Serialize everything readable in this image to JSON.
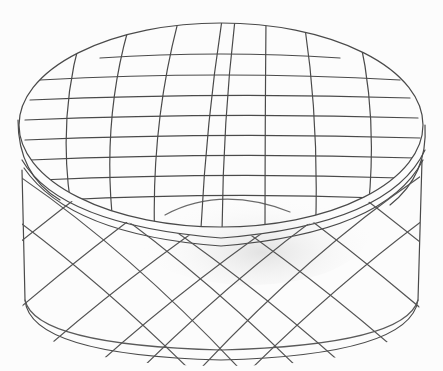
{
  "image": {
    "subject": "Pencil sketch of a round cylindrical tin box with lid",
    "pattern": "crosshatch grid lines on lid, diagonal lattice on side",
    "stroke_color": "#4a4a4a",
    "background_color": "#fcfcfc",
    "shade_color": "#e6e6e6"
  }
}
